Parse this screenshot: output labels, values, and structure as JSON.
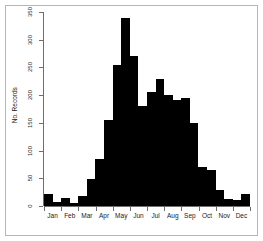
{
  "chart_data": {
    "type": "bar",
    "title": "",
    "subtitle": "",
    "xlabel": "",
    "ylabel": "No. Records",
    "ylim": [
      0,
      350
    ],
    "yticks": [
      0,
      50,
      100,
      150,
      200,
      250,
      300,
      350
    ],
    "ytick_labels": [
      "0",
      "50",
      "100",
      "150",
      "200",
      "250",
      "300",
      "350"
    ],
    "grid": false,
    "legend": null,
    "bar_color": "#000000",
    "axis_color": "#6e6e6e",
    "month_labels": [
      "Jan",
      "Feb",
      "Mar",
      "Apr",
      "May",
      "Jun",
      "Jul",
      "Aug",
      "Sep",
      "Oct",
      "Nov",
      "Dec"
    ],
    "categories": [
      "Jan a",
      "Jan b",
      "Feb a",
      "Feb b",
      "Mar a",
      "Mar b",
      "Apr a",
      "Apr b",
      "May a",
      "May b",
      "Jun a",
      "Jun b",
      "Jul a",
      "Jul b",
      "Aug a",
      "Aug b",
      "Sep a",
      "Sep b",
      "Oct a",
      "Oct b",
      "Nov a",
      "Nov b",
      "Dec a",
      "Dec b"
    ],
    "values": [
      22,
      8,
      14,
      6,
      18,
      48,
      85,
      155,
      255,
      340,
      270,
      180,
      205,
      230,
      200,
      192,
      195,
      150,
      70,
      65,
      28,
      12,
      10,
      22
    ]
  },
  "axis": {
    "y_label": "No. Records",
    "y_ticks": [
      "0",
      "50",
      "100",
      "150",
      "200",
      "250",
      "300",
      "350"
    ],
    "x_ticks": [
      "Jan",
      "Feb",
      "Mar",
      "Apr",
      "May",
      "Jun",
      "Jul",
      "Aug",
      "Sep",
      "Oct",
      "Nov",
      "Dec"
    ]
  }
}
